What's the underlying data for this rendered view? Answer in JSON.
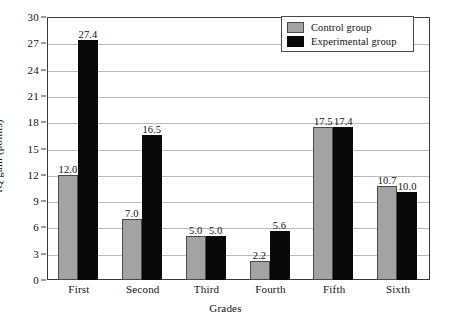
{
  "chart_data": {
    "type": "bar",
    "title": "",
    "xlabel": "Grades",
    "ylabel": "IQ gain (points)",
    "ylim": [
      0,
      30
    ],
    "ytick_step": 3,
    "yticks": [
      "30",
      "27",
      "24",
      "21",
      "18",
      "15",
      "12",
      "9",
      "6",
      "3",
      "0"
    ],
    "grid": true,
    "legend_position": "top-right",
    "categories": [
      "First",
      "Second",
      "Third",
      "Fourth",
      "Fifth",
      "Sixth"
    ],
    "series": [
      {
        "name": "Control group",
        "color": "#a3a3a3",
        "values": [
          12.0,
          7.0,
          5.0,
          2.2,
          17.5,
          10.7
        ],
        "labels": [
          "12.0",
          "7.0",
          "5.0",
          "2.2",
          "17.5",
          "10.7"
        ]
      },
      {
        "name": "Experimental group",
        "color": "#080808",
        "values": [
          27.4,
          16.5,
          5.0,
          5.6,
          17.4,
          10.0
        ],
        "labels": [
          "27.4",
          "16.5",
          "5.0",
          "5.6",
          "17.4",
          "10.0"
        ]
      }
    ]
  }
}
